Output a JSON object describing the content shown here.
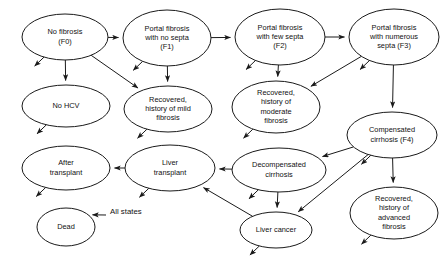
{
  "figure": {
    "type": "state-transition-diagram",
    "title": "",
    "background_color": "#ffffff",
    "stroke_color": "#1a1a1a",
    "text_color": "#111111"
  },
  "nodes": [
    {
      "id": "f0",
      "label_lines": [
        "No fibrosis",
        "(F0)"
      ],
      "cx": 65,
      "cy": 37,
      "rx": 43,
      "ry": 23
    },
    {
      "id": "f1",
      "label_lines": [
        "Portal fibrosis",
        "with no septa",
        "(F1)"
      ],
      "cx": 167,
      "cy": 38,
      "rx": 44,
      "ry": 28
    },
    {
      "id": "f2",
      "label_lines": [
        "Portal fibrosis",
        "with few septa",
        "(F2)"
      ],
      "cx": 280,
      "cy": 37,
      "rx": 45,
      "ry": 28
    },
    {
      "id": "f3",
      "label_lines": [
        "Portal fibrosis",
        "with numerous",
        "septa (F3)"
      ],
      "cx": 394,
      "cy": 37,
      "rx": 45,
      "ry": 28
    },
    {
      "id": "nohcv",
      "label_lines": [
        "No HCV"
      ],
      "cx": 66,
      "cy": 106,
      "rx": 44,
      "ry": 21
    },
    {
      "id": "recmild",
      "label_lines": [
        "Recovered,",
        "history of mild",
        "fibrosis"
      ],
      "cx": 168,
      "cy": 109,
      "rx": 44,
      "ry": 23
    },
    {
      "id": "recmod",
      "label_lines": [
        "Recovered,",
        "history of",
        "moderate",
        "fibrosis"
      ],
      "cx": 276,
      "cy": 107,
      "rx": 44,
      "ry": 26
    },
    {
      "id": "f4",
      "label_lines": [
        "Compensated",
        "cirrhosis (F4)"
      ],
      "cx": 392,
      "cy": 135,
      "rx": 45,
      "ry": 23
    },
    {
      "id": "decomp",
      "label_lines": [
        "Decompensated",
        "cirrhosis"
      ],
      "cx": 279,
      "cy": 170,
      "rx": 47,
      "ry": 22
    },
    {
      "id": "livertx",
      "label_lines": [
        "Liver",
        "transplant"
      ],
      "cx": 170,
      "cy": 168,
      "rx": 45,
      "ry": 23
    },
    {
      "id": "aftertx",
      "label_lines": [
        "After",
        "transplant"
      ],
      "cx": 66,
      "cy": 168,
      "rx": 44,
      "ry": 22
    },
    {
      "id": "recadv",
      "label_lines": [
        "Recovered,",
        "history of",
        "advanced",
        "fibrosis"
      ],
      "cx": 394,
      "cy": 213,
      "rx": 44,
      "ry": 26
    },
    {
      "id": "livercancer",
      "label_lines": [
        "Liver cancer"
      ],
      "cx": 276,
      "cy": 230,
      "rx": 36,
      "ry": 18
    },
    {
      "id": "dead",
      "label_lines": [
        "Dead"
      ],
      "cx": 66,
      "cy": 227,
      "rx": 29,
      "ry": 19
    }
  ],
  "edges": [
    {
      "from": "f0",
      "to": "f1",
      "kind": "straight"
    },
    {
      "from": "f1",
      "to": "f2",
      "kind": "straight"
    },
    {
      "from": "f2",
      "to": "f3",
      "kind": "straight"
    },
    {
      "from": "f0",
      "to": "nohcv",
      "kind": "straight"
    },
    {
      "from": "f0",
      "to": "recmild",
      "kind": "diagonal"
    },
    {
      "from": "f1",
      "to": "recmild",
      "kind": "straight"
    },
    {
      "from": "f2",
      "to": "recmod",
      "kind": "straight"
    },
    {
      "from": "f3",
      "to": "recmod",
      "kind": "diagonal"
    },
    {
      "from": "f3",
      "to": "f4",
      "kind": "straight"
    },
    {
      "from": "f4",
      "to": "decomp",
      "kind": "diagonal"
    },
    {
      "from": "f4",
      "to": "recadv",
      "kind": "straight"
    },
    {
      "from": "f4",
      "to": "livercancer",
      "kind": "diagonal"
    },
    {
      "from": "decomp",
      "to": "livercancer",
      "kind": "straight"
    },
    {
      "from": "decomp",
      "to": "livertx",
      "kind": "straight"
    },
    {
      "from": "livercancer",
      "to": "livertx",
      "kind": "diagonal"
    },
    {
      "from": "livertx",
      "to": "aftertx",
      "kind": "straight"
    }
  ],
  "death_stubs": [
    {
      "node": "f0"
    },
    {
      "node": "f1"
    },
    {
      "node": "f2"
    },
    {
      "node": "f3"
    },
    {
      "node": "nohcv"
    },
    {
      "node": "recmild"
    },
    {
      "node": "recmod"
    },
    {
      "node": "f4"
    },
    {
      "node": "decomp"
    },
    {
      "node": "livertx"
    },
    {
      "node": "aftertx"
    },
    {
      "node": "recadv"
    },
    {
      "node": "livercancer"
    }
  ],
  "annotations": [
    {
      "id": "all-states",
      "text": "All states",
      "x": 110,
      "y": 212
    }
  ]
}
